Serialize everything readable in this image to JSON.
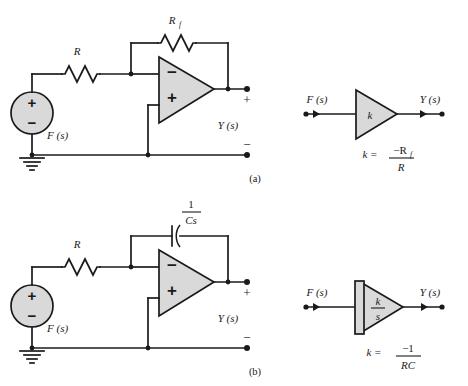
{
  "figure": {
    "type": "circuit-diagram",
    "panels": [
      {
        "tag": "(a)",
        "name": "inverting-amplifier",
        "circuit": {
          "source_label": "F (s)",
          "source_plus": "+",
          "source_minus": "−",
          "input_resistor_label": "R",
          "feedback_element_label": "R",
          "feedback_element_subscript": "f",
          "feedback_element_type": "resistor",
          "opamp_inverting_sign": "−",
          "opamp_noninverting_sign": "+",
          "output_label": "Y (s)",
          "output_plus": "+",
          "output_minus": "−"
        },
        "block": {
          "input_label": "F (s)",
          "output_label": "Y (s)",
          "gain_label": "k",
          "shape": "triangle",
          "equation_lhs": "k  =",
          "equation_numerator": "−R",
          "equation_numerator_subscript": "f",
          "equation_denominator": "R"
        }
      },
      {
        "tag": "(b)",
        "name": "inverting-integrator",
        "circuit": {
          "source_label": "F (s)",
          "source_plus": "+",
          "source_minus": "−",
          "input_resistor_label": "R",
          "feedback_element_numerator": "1",
          "feedback_element_denominator": "Cs",
          "feedback_element_type": "capacitor",
          "opamp_inverting_sign": "−",
          "opamp_noninverting_sign": "+",
          "output_label": "Y (s)",
          "output_plus": "+",
          "output_minus": "−"
        },
        "block": {
          "input_label": "F (s)",
          "output_label": "Y (s)",
          "gain_numerator": "k",
          "gain_denominator": "s",
          "shape": "integrator-triangle",
          "equation_lhs": "k  =",
          "equation_numerator": "−1",
          "equation_denominator": "RC"
        }
      }
    ]
  },
  "colors": {
    "line": "#1a1a1a",
    "component_fill": "#d9d9d9",
    "background": "#ffffff"
  }
}
